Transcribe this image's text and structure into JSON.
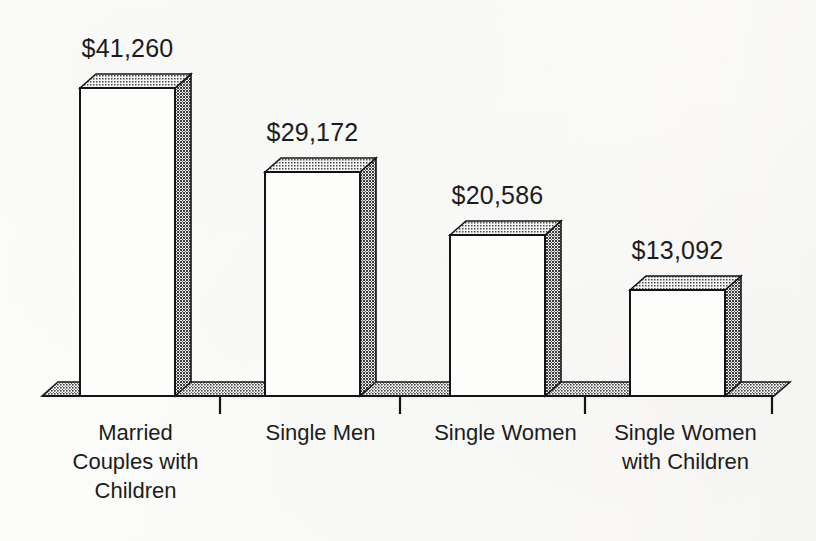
{
  "chart_data": {
    "type": "bar",
    "title": "",
    "subtitle": "",
    "xlabel": "",
    "ylabel": "",
    "grid": false,
    "legend": "none",
    "style": "3d-bar-scanned",
    "ylim": [
      0,
      48000
    ],
    "categories": [
      "Married Couples with Children",
      "Single Men",
      "Single Women",
      "Single Women with Children"
    ],
    "category_lines": [
      [
        "Married",
        "Couples with",
        "Children"
      ],
      [
        "Single Men"
      ],
      [
        "Single Women"
      ],
      [
        "Single Women",
        "with Children"
      ]
    ],
    "values": [
      41260,
      29172,
      20586,
      13092
    ],
    "data_labels": [
      "$41,260",
      "$29,172",
      "$20,586",
      "$13,092"
    ],
    "axis_ticks": [
      "",
      "",
      "",
      ""
    ],
    "tick_labels_visible": false
  },
  "colors": {
    "background": "#fbfbfa",
    "ink": "#1c1c1c",
    "bar_front": "#fdfdfc",
    "bar_side": "#6e6e6e",
    "bar_top": "#9a9a9a",
    "floor_top": "#8b8b8b",
    "outline": "#141414"
  },
  "geometry": {
    "baseline_y": 396,
    "depth_x": 16,
    "depth_y": 14,
    "bar_width": 95,
    "bar_left_x": [
      80,
      265,
      450,
      630
    ],
    "bar_top_y": [
      88,
      172,
      235,
      290
    ],
    "floor_left_x": 42,
    "floor_right_x": 790,
    "tick_x": [
      220,
      400,
      585,
      772
    ],
    "tick_length": 18
  }
}
